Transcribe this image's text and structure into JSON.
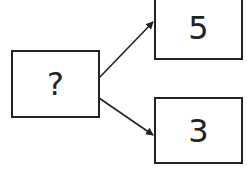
{
  "diagram": {
    "type": "tree",
    "nodes": [
      {
        "id": "source",
        "label": "?"
      },
      {
        "id": "top",
        "label": "5"
      },
      {
        "id": "bottom",
        "label": "3"
      }
    ],
    "edges": [
      {
        "from": "source",
        "to": "top"
      },
      {
        "from": "source",
        "to": "bottom"
      }
    ],
    "colors": {
      "stroke": "#222222",
      "background": "#ffffff"
    }
  }
}
